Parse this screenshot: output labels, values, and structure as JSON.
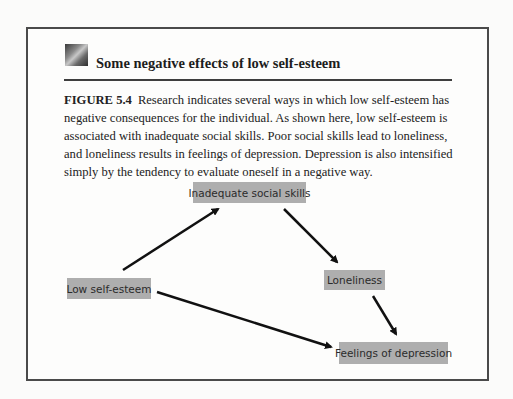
{
  "header": {
    "title": "Some negative effects of low self-esteem",
    "icon": "photo-thumbnail-icon"
  },
  "caption": {
    "figure_label": "FIGURE 5.4",
    "text": "Research indicates several ways in which low self-esteem has negative consequences for the individual. As shown here, low self-esteem is associated with inadequate social skills. Poor social skills lead to loneliness, and loneliness results in feelings of depression. Depression is also intensified simply by the tendency to evaluate oneself in a negative way."
  },
  "diagram": {
    "nodes": [
      {
        "id": "low_self_esteem",
        "label": "Low self-esteem"
      },
      {
        "id": "inadequate_social_skills",
        "label": "Inadequate social skills"
      },
      {
        "id": "loneliness",
        "label": "Loneliness"
      },
      {
        "id": "feelings_of_depression",
        "label": "Feelings of depression"
      }
    ],
    "edges": [
      {
        "from": "low_self_esteem",
        "to": "inadequate_social_skills"
      },
      {
        "from": "inadequate_social_skills",
        "to": "loneliness"
      },
      {
        "from": "loneliness",
        "to": "feelings_of_depression"
      },
      {
        "from": "low_self_esteem",
        "to": "feelings_of_depression"
      }
    ],
    "colors": {
      "node_fill": "#aeaeae",
      "arrow": "#111111"
    }
  }
}
